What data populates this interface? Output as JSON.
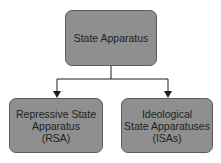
{
  "diagram": {
    "type": "hierarchy",
    "root": {
      "label": "State Apparatus"
    },
    "children": [
      {
        "lines": [
          "Repressive State",
          "Apparatus",
          "(RSA)"
        ]
      },
      {
        "lines": [
          "Ideological",
          "State Apparatuses",
          "(ISAs)"
        ]
      }
    ],
    "colors": {
      "box_fill": "#8f8f8f",
      "box_border": "#5a5a5a",
      "line": "#1e1e1e",
      "text": "#1e1e1e"
    }
  }
}
